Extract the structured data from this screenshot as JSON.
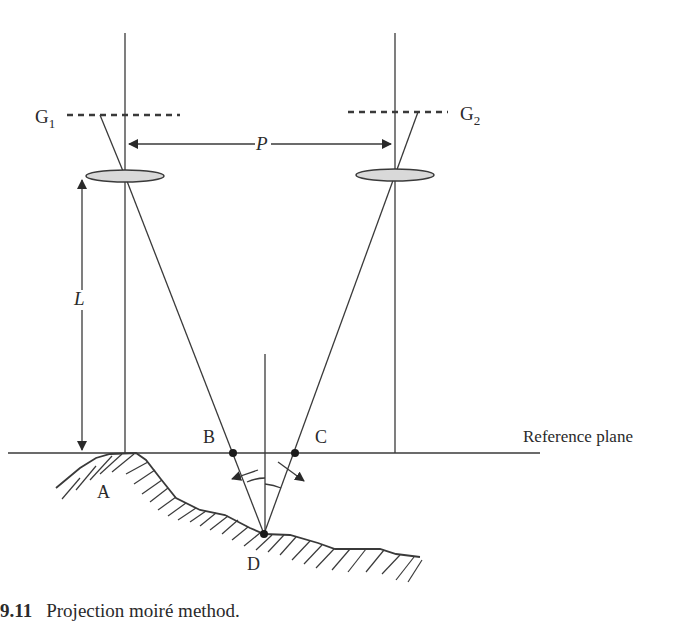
{
  "figure": {
    "labels": {
      "g1": "G",
      "g1_sub": "1",
      "g2": "G",
      "g2_sub": "2",
      "p": "P",
      "l": "L",
      "a": "A",
      "b": "B",
      "c": "C",
      "d": "D",
      "reference_plane": "Reference plane"
    },
    "colors": {
      "line": "#3a3a3a",
      "lens_fill": "#d9d9d9",
      "text": "#2a2a2a"
    }
  },
  "caption": {
    "number": "9.11",
    "text": "Projection moiré method."
  }
}
